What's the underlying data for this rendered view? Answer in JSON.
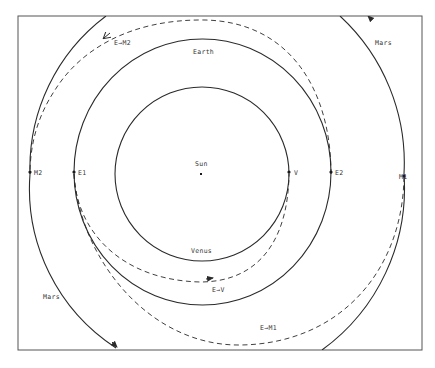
{
  "diagram": {
    "title": "",
    "bodies": {
      "sun": "Sun",
      "venus": "Venus",
      "earth": "Earth",
      "mars_top": "Mars",
      "mars_bottom": "Mars"
    },
    "points": {
      "m2": "M2",
      "e1": "E1",
      "v": "V",
      "e2": "E2",
      "m1": "M1"
    },
    "transfers": {
      "earth_to_mars2": "E→M2",
      "earth_to_venus": "E→V",
      "earth_to_mars1": "E→M1"
    },
    "colors": {
      "line": "#2a2a2a",
      "frame": "#555555",
      "background": "#ffffff"
    }
  }
}
